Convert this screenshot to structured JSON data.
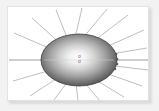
{
  "figure": {
    "type": "vector-illustration",
    "background_color": "#f2f2f2",
    "panel_color": "#ffffff",
    "panel_border_color": "#e2e2e2",
    "shadow_color": "#d8d8d8",
    "ellipse": {
      "center_x": 71,
      "center_y": 53,
      "radius_x": 38,
      "radius_y": 26,
      "fill_center_color": "#fcfcfc",
      "fill_mid_color": "#b4b4b4",
      "fill_edge_color": "#4a4a4a",
      "outline_color": "#3f3f3f"
    },
    "rays": {
      "count": 18,
      "color": "#9a9a9a",
      "stroke_width": 0.6,
      "inner_radius_factor": 0.55,
      "outer_length": 64,
      "angles_deg": [
        0,
        20,
        40,
        60,
        80,
        100,
        120,
        140,
        160,
        180,
        200,
        220,
        240,
        260,
        280,
        300,
        320,
        340
      ]
    },
    "axis_line": {
      "label": "horizontal-axis",
      "color": "#b0b0b0",
      "y": 53,
      "x_start": 1,
      "x_end": 141
    },
    "edge_markers": {
      "count": 4,
      "color": "#5a5a5a",
      "x": 108,
      "ys": [
        47,
        52,
        57,
        62
      ]
    },
    "center_marker": {
      "top_char": "o",
      "bottom_char": "o",
      "color": "#6b6b6b"
    }
  }
}
